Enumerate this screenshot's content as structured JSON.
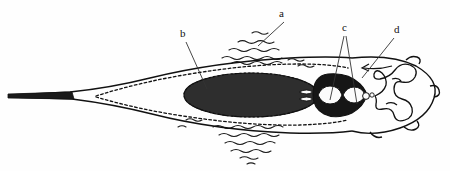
{
  "figure": {
    "background_color": "#fefefe",
    "ink_color": "#111111",
    "fill_dark": "#2b2b2b",
    "width": 450,
    "height": 171
  },
  "labels": [
    {
      "id": "a",
      "text": "a",
      "x": 279,
      "y": 8,
      "leader_from": [
        284,
        22
      ],
      "leader_to": [
        258,
        46
      ],
      "description": "fin membrane wavy hatching, dorsal"
    },
    {
      "id": "b",
      "text": "b",
      "x": 180,
      "y": 28,
      "leader_from": [
        186,
        42
      ],
      "leader_to": [
        207,
        89
      ],
      "description": "large dark yolk mass / body trunk"
    },
    {
      "id": "c",
      "text": "c",
      "x": 342,
      "y": 22,
      "leader_from": [
        344,
        36
      ],
      "leader_to": [
        330,
        100
      ],
      "leader_to_2": [
        352,
        104
      ],
      "description": "paired median structures"
    },
    {
      "id": "d",
      "text": "d",
      "x": 394,
      "y": 24,
      "leader_from": [
        394,
        38
      ],
      "leader_to": [
        362,
        78
      ],
      "description": "coiled lateral appendage / gut loop"
    }
  ],
  "anatomy": {
    "parts": [
      "tail-tip",
      "tail-shaft",
      "body-outline",
      "dashed-inner-outline",
      "dark-yolk-mass",
      "median-organ-cluster",
      "coiled-structure",
      "head-outline",
      "dorsal-fin-hatching",
      "ventral-fin-hatching",
      "dashed-arrow-marker"
    ]
  }
}
